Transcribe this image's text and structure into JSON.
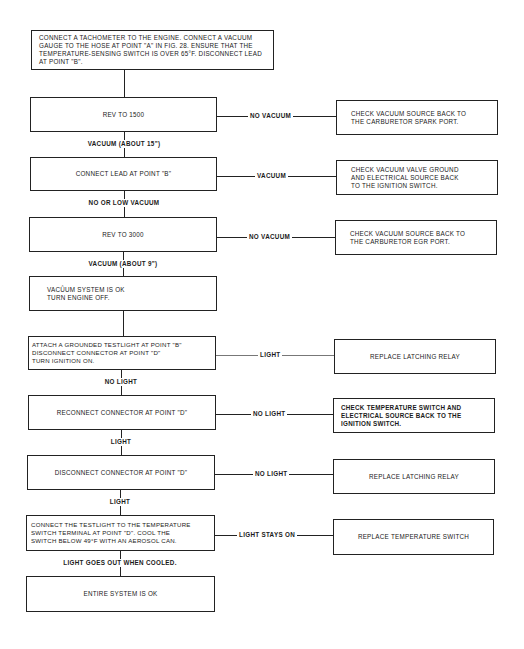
{
  "flowchart": {
    "start": "CONNECT A TACHOMETER TO THE ENGINE. CONNECT A VACUUM\nGAUGE TO THE HOSE AT POINT \"A\" IN FIG. 28. ENSURE THAT THE\nTEMPERATURE-SENSING SWITCH IS OVER 65°F. DISCONNECT LEAD\nAT POINT \"B\".",
    "steps": [
      {
        "text": "REV TO 1500",
        "branch_label": "NO VACUUM",
        "branch_result": "CHECK VACUUM SOURCE BACK TO\nTHE CARBURETOR SPARK PORT.",
        "next_label": "VACUUM (ABOUT 15\")"
      },
      {
        "text": "CONNECT LEAD AT POINT \"B\"",
        "branch_label": "VACUUM",
        "branch_result": "CHECK VACUUM VALVE GROUND\nAND ELECTRICAL SOURCE BACK\nTO THE IGNITION SWITCH.",
        "next_label": "NO OR LOW VACUUM"
      },
      {
        "text": "REV TO 3000",
        "branch_label": "NO VACUUM",
        "branch_result": "CHECK VACUUM SOURCE BACK TO\nTHE CARBURETOR EGR PORT.",
        "next_label": "VACUUM (ABOUT 9\")"
      },
      {
        "text": "VACÛUM SYSTEM IS OK\nTURN ENGINE OFF.",
        "next_label": ""
      },
      {
        "text": "ATTACH A GROUNDED TESTLIGHT AT POINT \"B\"\nDISCONNECT CONNECTOR AT POINT \"D\"\nTURN IGNITION ON.",
        "branch_label": "LIGHT",
        "branch_result": "REPLACE LATCHING RELAY",
        "next_label": "NO LIGHT"
      },
      {
        "text": "RECONNECT CONNECTOR AT POINT \"D\"",
        "branch_label": "NO LIGHT",
        "branch_result": "CHECK TEMPERATURE SWITCH AND\nELECTRICAL SOURCE BACK TO THE\nIGNITION SWITCH.",
        "next_label": "LIGHT"
      },
      {
        "text": "DISCONNECT CONNECTOR AT POINT \"D\"",
        "branch_label": "NO LIGHT",
        "branch_result": "REPLACE LATCHING RELAY",
        "next_label": "LIGHT"
      },
      {
        "text": "CONNECT THE TESTLIGHT TO THE TEMPERATURE\nSWITCH TERMINAL AT POINT \"D\". COOL THE\nSWITCH BELOW 49°F WITH AN AEROSOL CAN.",
        "branch_label": "LIGHT STAYS ON",
        "branch_result": "REPLACE TEMPERATURE SWITCH",
        "next_label": "LIGHT GOES OUT WHEN COOLED."
      },
      {
        "text": "ENTIRE SYSTEM IS OK"
      }
    ]
  }
}
